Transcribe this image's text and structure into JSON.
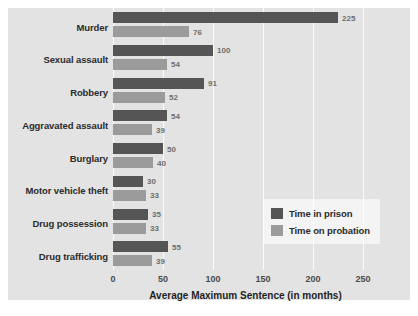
{
  "chart_data": {
    "type": "bar",
    "title": "",
    "subtitle": "",
    "xlabel": "Average Maximum Sentence (in months)",
    "ylabel": "",
    "orientation": "horizontal",
    "grid": true,
    "xlim": [
      0,
      265
    ],
    "xticks": [
      0,
      50,
      100,
      150,
      200,
      250
    ],
    "xtick_labels": [
      "0",
      "50",
      "100",
      "150",
      "200",
      "250"
    ],
    "categories": [
      "Murder",
      "Sexual assault",
      "Robbery",
      "Aggravated assault",
      "Burglary",
      "Motor vehicle theft",
      "Drug possession",
      "Drug trafficking"
    ],
    "series": [
      {
        "name": "Time in prison",
        "color": "#555555",
        "values": [
          225,
          100,
          91,
          54,
          50,
          30,
          35,
          55
        ]
      },
      {
        "name": "Time on probation",
        "color": "#9b9b9b",
        "values": [
          76,
          54,
          52,
          39,
          40,
          33,
          33,
          39
        ]
      }
    ],
    "legend": {
      "position": "middle-right-inside",
      "entries": [
        {
          "label": "Time in prison",
          "color": "#555555"
        },
        {
          "label": "Time on probation",
          "color": "#9b9b9b"
        }
      ]
    },
    "colors": {
      "plot_background": "#e3e3e3",
      "figure_background": "#ffffff",
      "gridline": "#fbfbfb",
      "value_label": "#6e6e6e",
      "category_label": "#2b2b2b"
    }
  }
}
